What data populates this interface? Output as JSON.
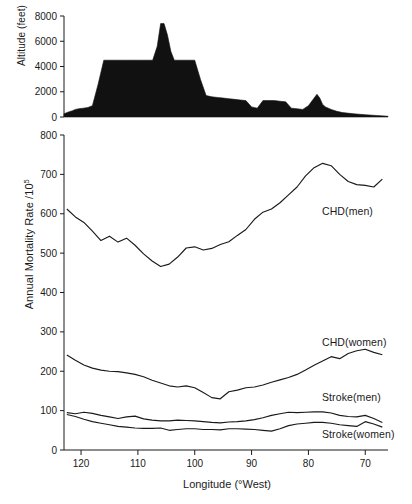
{
  "chart_data": [
    {
      "type": "area",
      "title": "",
      "xlabel": "",
      "ylabel": "Altitude (feet)",
      "ylim": [
        0,
        8000
      ],
      "yticks": [
        0,
        2000,
        4000,
        6000,
        8000
      ],
      "ytick_labels": [
        "0",
        "2000",
        "4000",
        "6000",
        "8000"
      ],
      "xlim": [
        123,
        66
      ],
      "grid": false,
      "fill_color": "#111111",
      "series": [
        {
          "name": "Altitude profile",
          "x": [
            123.0,
            122.2,
            121.5,
            121.0,
            120.4,
            119.6,
            118.8,
            118.0,
            117.0,
            116.0,
            115.0,
            114.0,
            113.0,
            112.0,
            111.0,
            110.0,
            109.0,
            108.2,
            107.4,
            106.6,
            106.0,
            105.4,
            104.8,
            104.2,
            103.6,
            103.0,
            102.4,
            101.6,
            100.8,
            100.0,
            99.0,
            98.0,
            97.0,
            96.0,
            95.0,
            94.0,
            93.0,
            92.0,
            91.0,
            90.0,
            89.0,
            88.0,
            87.0,
            86.0,
            85.0,
            84.0,
            83.0,
            82.0,
            81.0,
            80.0,
            79.0,
            78.5,
            78.0,
            77.5,
            77.0,
            76.0,
            75.0,
            74.0,
            72.0,
            70.0,
            68.0,
            66.0
          ],
          "values": [
            250,
            400,
            500,
            600,
            650,
            700,
            750,
            900,
            2600,
            4500,
            4500,
            4500,
            4500,
            4500,
            4500,
            4500,
            4500,
            4500,
            4500,
            5600,
            7400,
            7400,
            6500,
            5200,
            4500,
            4500,
            4500,
            4500,
            4500,
            4500,
            3000,
            1700,
            1600,
            1550,
            1500,
            1450,
            1400,
            1350,
            1300,
            800,
            700,
            1300,
            1300,
            1300,
            1250,
            1200,
            700,
            650,
            600,
            900,
            1500,
            1800,
            1500,
            1000,
            800,
            600,
            450,
            350,
            250,
            180,
            120,
            60
          ]
        }
      ]
    },
    {
      "type": "line",
      "title": "",
      "xlabel": "Longitude (°West)",
      "ylabel": "Annual Mortality Rate /10 5",
      "ylim": [
        0,
        800
      ],
      "yticks": [
        0,
        100,
        200,
        300,
        400,
        500,
        600,
        700,
        800
      ],
      "ytick_labels": [
        "0",
        "100",
        "200",
        "300",
        "400",
        "500",
        "600",
        "700",
        "800"
      ],
      "xlim": [
        123,
        66
      ],
      "xticks": [
        120,
        110,
        100,
        90,
        80,
        70
      ],
      "xtick_labels": [
        "120",
        "110",
        "100",
        "90",
        "80",
        "70"
      ],
      "grid": false,
      "line_color": "#1a1a1a",
      "series": [
        {
          "name": "CHD(men)",
          "label_position": {
            "x": 322,
            "y": 205
          },
          "x": [
            122.5,
            121.0,
            119.5,
            118.0,
            116.5,
            115.0,
            113.5,
            112.0,
            110.5,
            109.0,
            107.5,
            106.0,
            104.5,
            103.0,
            101.5,
            100.0,
            98.5,
            97.0,
            95.5,
            94.0,
            92.5,
            91.0,
            89.5,
            88.0,
            86.5,
            85.0,
            83.5,
            82.0,
            80.5,
            79.0,
            77.5,
            76.0,
            74.5,
            73.0,
            71.5,
            70.0,
            68.5,
            67.0
          ],
          "values": [
            612,
            592,
            578,
            556,
            532,
            543,
            528,
            538,
            520,
            498,
            480,
            466,
            472,
            490,
            513,
            516,
            508,
            512,
            522,
            529,
            545,
            560,
            586,
            604,
            612,
            628,
            648,
            668,
            696,
            717,
            728,
            722,
            700,
            682,
            674,
            672,
            668,
            688
          ]
        },
        {
          "name": "CHD(women)",
          "label_position": {
            "x": 322,
            "y": 336
          },
          "x": [
            122.5,
            121.0,
            119.5,
            118.0,
            116.5,
            115.0,
            113.5,
            112.0,
            110.5,
            109.0,
            107.5,
            106.0,
            104.5,
            103.0,
            101.5,
            100.0,
            98.5,
            97.0,
            95.5,
            94.0,
            92.5,
            91.0,
            89.5,
            88.0,
            86.5,
            85.0,
            83.5,
            82.0,
            80.5,
            79.0,
            77.5,
            76.0,
            74.5,
            73.0,
            71.5,
            70.0,
            68.5,
            67.0
          ],
          "values": [
            241,
            228,
            216,
            208,
            203,
            200,
            199,
            196,
            192,
            186,
            177,
            170,
            163,
            160,
            163,
            158,
            146,
            133,
            130,
            148,
            152,
            158,
            160,
            165,
            172,
            178,
            184,
            192,
            203,
            215,
            226,
            237,
            232,
            245,
            252,
            256,
            248,
            242
          ]
        },
        {
          "name": "Stroke(men)",
          "label_position": {
            "x": 322,
            "y": 391
          },
          "x": [
            122.5,
            121.0,
            119.5,
            118.0,
            116.5,
            115.0,
            113.5,
            112.0,
            110.5,
            109.0,
            107.5,
            106.0,
            104.5,
            103.0,
            101.5,
            100.0,
            98.5,
            97.0,
            95.5,
            94.0,
            92.5,
            91.0,
            89.5,
            88.0,
            86.5,
            85.0,
            83.5,
            82.0,
            80.5,
            79.0,
            77.5,
            76.0,
            74.5,
            73.0,
            71.5,
            70.0,
            68.5,
            67.0
          ],
          "values": [
            95,
            92,
            96,
            93,
            88,
            84,
            80,
            84,
            86,
            79,
            76,
            74,
            74,
            76,
            75,
            74,
            72,
            70,
            69,
            71,
            72,
            74,
            77,
            82,
            88,
            92,
            96,
            95,
            96,
            97,
            97,
            94,
            88,
            85,
            84,
            88,
            80,
            70
          ]
        },
        {
          "name": "Stroke(women)",
          "label_position": {
            "x": 322,
            "y": 428
          },
          "x": [
            122.5,
            121.0,
            119.5,
            118.0,
            116.5,
            115.0,
            113.5,
            112.0,
            110.5,
            109.0,
            107.5,
            106.0,
            104.5,
            103.0,
            101.5,
            100.0,
            98.5,
            97.0,
            95.5,
            94.0,
            92.5,
            91.0,
            89.5,
            88.0,
            86.5,
            85.0,
            83.5,
            82.0,
            80.5,
            79.0,
            77.5,
            76.0,
            74.5,
            73.0,
            71.5,
            70.0,
            68.5,
            67.0
          ],
          "values": [
            90,
            85,
            78,
            72,
            68,
            64,
            60,
            58,
            56,
            55,
            55,
            56,
            50,
            52,
            54,
            54,
            52,
            52,
            51,
            54,
            54,
            53,
            52,
            50,
            48,
            54,
            62,
            66,
            68,
            70,
            70,
            68,
            64,
            62,
            60,
            72,
            66,
            58
          ]
        }
      ]
    }
  ],
  "axes": {
    "altitude": {
      "ylabel": "Altitude (feet)",
      "ytick_labels": [
        "8000",
        "6000",
        "4000",
        "2000",
        "0"
      ]
    },
    "mortality": {
      "ylabel_main": "Annual Mortality Rate /10",
      "ylabel_sup": "5",
      "xlabel": "Longitude (°West)",
      "ytick_labels": [
        "800",
        "700",
        "600",
        "500",
        "400",
        "300",
        "200",
        "100",
        "0"
      ],
      "xtick_labels": [
        "120",
        "110",
        "100",
        "90",
        "80",
        "70"
      ]
    }
  },
  "curve_labels": {
    "chd_men": "CHD(men)",
    "chd_women": "CHD(women)",
    "stroke_men": "Stroke(men)",
    "stroke_women": "Stroke(women)"
  }
}
